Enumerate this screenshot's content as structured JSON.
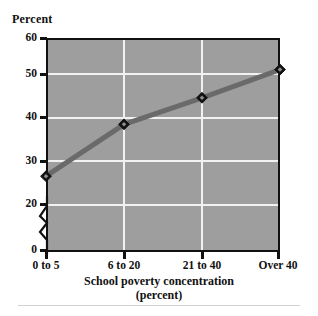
{
  "chart_data": {
    "type": "line",
    "title": "",
    "xlabel": "School poverty concentration (percent)",
    "ylabel": "Percent",
    "categories": [
      "0 to 5",
      "6 to 20",
      "21 to 40",
      "Over 40"
    ],
    "values": [
      26.7,
      39.2,
      45.6,
      52.4
    ],
    "series": [
      {
        "name": "Percent",
        "values": [
          26.7,
          39.2,
          45.6,
          52.4
        ]
      }
    ],
    "ylim": [
      0,
      60
    ],
    "yticks": [
      0,
      20,
      30,
      40,
      50,
      60
    ],
    "ytick_labels": [
      "0",
      "20",
      "30",
      "40",
      "50",
      "60"
    ],
    "axis_break": true,
    "axis_break_between": [
      0,
      20
    ],
    "grid": true,
    "grid_color": "#f2f2f2",
    "legend": "none",
    "plot_background": "#9e9e9e",
    "line_color": "#6a6a6a",
    "marker": "diamond",
    "marker_color": "#111111"
  },
  "axes": {
    "y_title": "Percent",
    "x_title_line1": "School poverty concentration",
    "x_title_line2": "(percent)",
    "y_tick_labels": [
      "60",
      "50",
      "40",
      "30",
      "20",
      "0"
    ],
    "x_tick_labels": [
      "0 to 5",
      "6 to 20",
      "21 to 40",
      "Over 40"
    ]
  },
  "colors": {
    "plot_background": "#9e9e9e",
    "grid": "#f2f2f2",
    "line": "#6a6a6a",
    "marker": "#111111",
    "frame": "#111111",
    "text": "#111111",
    "footer_rule": "#d2d2d2"
  }
}
